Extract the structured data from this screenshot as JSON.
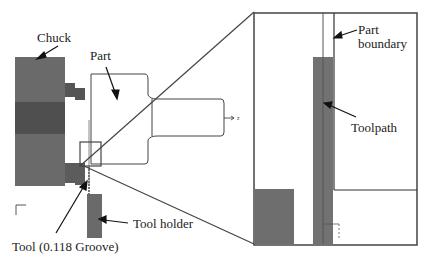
{
  "labels": {
    "chuck": "Chuck",
    "part": "Part",
    "part_boundary_line1": "Part",
    "part_boundary_line2": "boundary",
    "toolpath": "Toolpath",
    "tool_holder": "Tool holder",
    "tool": "Tool (0.118 Groove)"
  },
  "axis_label": "z",
  "colors": {
    "chuck_light": "#6e6e6e",
    "chuck_dark": "#505050",
    "tool_holder": "#707070",
    "outline": "#444444",
    "background": "#ffffff"
  }
}
